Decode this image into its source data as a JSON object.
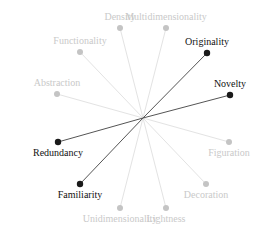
{
  "diagram": {
    "center": {
      "x": 143,
      "y": 118
    },
    "colors": {
      "strong_line": "#555555",
      "strong_dot": "#1a1a1a",
      "strong_text": "#111111",
      "faint_line": "#e3e3e3",
      "faint_dot": "#c4c4c4",
      "faint_text": "#c9c9c9"
    },
    "nodes": [
      {
        "id": "density",
        "label": "Density",
        "x": 120,
        "y": 28,
        "emphasis": "faint",
        "label_pos": "above"
      },
      {
        "id": "multidimensionality",
        "label": "Multidimensionality",
        "x": 166,
        "y": 28,
        "emphasis": "faint",
        "label_pos": "above"
      },
      {
        "id": "functionality",
        "label": "Functionality",
        "x": 80,
        "y": 52,
        "emphasis": "faint",
        "label_pos": "above"
      },
      {
        "id": "abstraction",
        "label": "Abstraction",
        "x": 57,
        "y": 94,
        "emphasis": "faint",
        "label_pos": "above"
      },
      {
        "id": "originality",
        "label": "Originality",
        "x": 207,
        "y": 53,
        "emphasis": "strong",
        "label_pos": "above"
      },
      {
        "id": "novelty",
        "label": "Novelty",
        "x": 230,
        "y": 95,
        "emphasis": "strong",
        "label_pos": "above"
      },
      {
        "id": "redundancy",
        "label": "Redundancy",
        "x": 58,
        "y": 142,
        "emphasis": "strong",
        "label_pos": "below"
      },
      {
        "id": "familiarity",
        "label": "Familiarity",
        "x": 80,
        "y": 184,
        "emphasis": "strong",
        "label_pos": "below"
      },
      {
        "id": "unidimensionality",
        "label": "Unidimensionality",
        "x": 120,
        "y": 208,
        "emphasis": "faint",
        "label_pos": "below"
      },
      {
        "id": "lightness",
        "label": "Lightness",
        "x": 166,
        "y": 208,
        "emphasis": "faint",
        "label_pos": "below"
      },
      {
        "id": "decoration",
        "label": "Decoration",
        "x": 206,
        "y": 184,
        "emphasis": "faint",
        "label_pos": "below"
      },
      {
        "id": "figuration",
        "label": "Figuration",
        "x": 229,
        "y": 142,
        "emphasis": "faint",
        "label_pos": "below"
      }
    ]
  }
}
